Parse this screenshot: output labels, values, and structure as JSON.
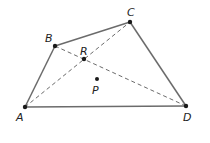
{
  "diagram": {
    "points": {
      "A": {
        "label": "A",
        "x": 25,
        "y": 107,
        "lx": 16,
        "ly": 121
      },
      "B": {
        "label": "B",
        "x": 55,
        "y": 46,
        "lx": 45,
        "ly": 42
      },
      "C": {
        "label": "C",
        "x": 130,
        "y": 22,
        "lx": 127,
        "ly": 16
      },
      "D": {
        "label": "D",
        "x": 186,
        "y": 106,
        "lx": 183,
        "ly": 121
      },
      "R": {
        "label": "R",
        "x": 84,
        "y": 59,
        "lx": 80,
        "ly": 55
      },
      "P": {
        "label": "P",
        "x": 97,
        "y": 79,
        "lx": 92,
        "ly": 94
      }
    },
    "solid_edges": [
      "AB",
      "BC",
      "CD",
      "DA"
    ],
    "dashed_edges": [
      "AC",
      "BD"
    ],
    "colors": {
      "edge": "#6b6b6b",
      "point": "#1a1a1a",
      "label": "#222222"
    }
  }
}
